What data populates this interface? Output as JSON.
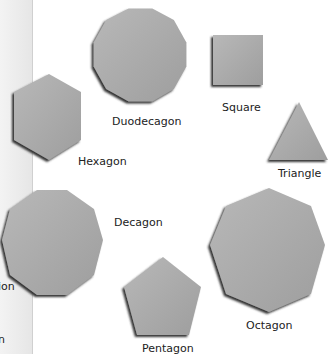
{
  "figure": {
    "shapes": [
      {
        "name": "Duodecagon",
        "sides": 12
      },
      {
        "name": "Square",
        "sides": 4
      },
      {
        "name": "Triangle",
        "sides": 3
      },
      {
        "name": "Hexagon",
        "sides": 6
      },
      {
        "name": "Decagon",
        "sides": 10
      },
      {
        "name": "Octagon",
        "sides": 8
      },
      {
        "name": "Pentagon",
        "sides": 5
      }
    ],
    "partial_labels": [
      "ion",
      "n"
    ],
    "colors": {
      "fill": "#a8a8a8",
      "shadow": "#3a3a3a",
      "highlight": "#d8d8d8",
      "strip": "#ececec"
    }
  }
}
